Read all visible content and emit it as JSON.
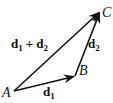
{
  "diagram": {
    "type": "vector-addition",
    "points": {
      "A": {
        "label": "A",
        "x": 14,
        "y": 91
      },
      "B": {
        "label": "B",
        "x": 75,
        "y": 76
      },
      "C": {
        "label": "C",
        "x": 100,
        "y": 12
      }
    },
    "vectors": [
      {
        "name": "d1",
        "base": "d",
        "sub": "1",
        "from": "A",
        "to": "B"
      },
      {
        "name": "d2",
        "base": "d",
        "sub": "2",
        "from": "B",
        "to": "C"
      },
      {
        "name": "d1+d2",
        "from": "A",
        "to": "C"
      }
    ],
    "labels": {
      "sum_left_base": "d",
      "sum_left_sub": "1",
      "sum_op": "+",
      "sum_right_base": "d",
      "sum_right_sub": "2"
    },
    "colors": {
      "stroke": "#111111",
      "background": "#ffffff"
    }
  }
}
